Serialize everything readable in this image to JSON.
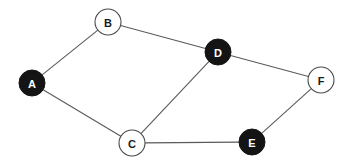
{
  "diagram": {
    "type": "node-link-graph",
    "background_color": "#ffffff",
    "edge_color": "#5a5a5a",
    "filled_node_color": "#141414",
    "open_node_color": "#ffffff",
    "open_node_border_color": "#4a4a4a",
    "filled_label_color": "#ffffff",
    "open_label_color": "#1a1a1a",
    "node_radius": 13,
    "nodes": [
      {
        "id": "A",
        "label": "A",
        "cx": 32,
        "cy": 83,
        "style": "filled"
      },
      {
        "id": "B",
        "label": "B",
        "cx": 108,
        "cy": 22,
        "style": "open"
      },
      {
        "id": "C",
        "label": "C",
        "cx": 132,
        "cy": 143,
        "style": "open"
      },
      {
        "id": "D",
        "label": "D",
        "cx": 218,
        "cy": 52,
        "style": "filled"
      },
      {
        "id": "E",
        "label": "E",
        "cx": 252,
        "cy": 142,
        "style": "filled"
      },
      {
        "id": "F",
        "label": "F",
        "cx": 321,
        "cy": 80,
        "style": "open"
      }
    ],
    "edges": [
      {
        "id": "A-B",
        "source": "A",
        "target": "B"
      },
      {
        "id": "A-C",
        "source": "A",
        "target": "C"
      },
      {
        "id": "B-D",
        "source": "B",
        "target": "D"
      },
      {
        "id": "C-D",
        "source": "C",
        "target": "D"
      },
      {
        "id": "C-E",
        "source": "C",
        "target": "E"
      },
      {
        "id": "D-F",
        "source": "D",
        "target": "F"
      },
      {
        "id": "E-F",
        "source": "E",
        "target": "F"
      }
    ]
  }
}
